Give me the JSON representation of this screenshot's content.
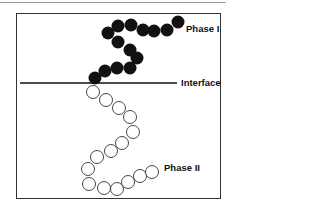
{
  "diagram": {
    "labels": {
      "phase1": "Phase I",
      "interface": "Interface",
      "phase2": "Phase II"
    },
    "colors": {
      "filled": "#111111",
      "outline": "#333333",
      "background": "#ffffff"
    },
    "interface_line": {
      "x1": 20,
      "x2": 177,
      "y": 83
    },
    "phase1_beads": [
      [
        178,
        22
      ],
      [
        167,
        30
      ],
      [
        154,
        31
      ],
      [
        143,
        30
      ],
      [
        131,
        25
      ],
      [
        118,
        26
      ],
      [
        108,
        33
      ],
      [
        118,
        42
      ],
      [
        130,
        50
      ],
      [
        137,
        58
      ],
      [
        130,
        68
      ],
      [
        117,
        68
      ],
      [
        105,
        71
      ],
      [
        95,
        78
      ]
    ],
    "phase2_beads": [
      [
        93,
        92
      ],
      [
        106,
        100
      ],
      [
        119,
        108
      ],
      [
        130,
        117
      ],
      [
        133,
        132
      ],
      [
        122,
        143
      ],
      [
        111,
        151
      ],
      [
        97,
        157
      ],
      [
        88,
        169
      ],
      [
        89,
        184
      ],
      [
        104,
        188
      ],
      [
        117,
        189
      ],
      [
        128,
        182
      ],
      [
        140,
        176
      ],
      [
        152,
        172
      ]
    ],
    "bead_radius": 6.5
  }
}
